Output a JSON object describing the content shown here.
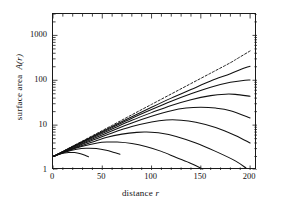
{
  "chart_data": {
    "type": "line",
    "title": "",
    "xlabel": "distance r",
    "ylabel": "surface area A(r)",
    "xlabel_plain": "distance",
    "xlabel_italic": "r",
    "ylabel_plain": "surface area",
    "ylabel_italic": "A(r)",
    "xlim": [
      0,
      207
    ],
    "ylim": [
      1,
      3000
    ],
    "yscale": "log",
    "xscale": "linear",
    "grid": false,
    "legend": false,
    "xticks": [
      0,
      50,
      100,
      150,
      200
    ],
    "xticklabels": [
      "0",
      "50",
      "100",
      "150",
      "200"
    ],
    "xminor_step": 10,
    "yticks": [
      1,
      10,
      100,
      1000
    ],
    "yticklabels": [
      "1",
      "10",
      "100",
      "1000"
    ],
    "frame": "box",
    "tick_direction": "in",
    "series": [
      {
        "name": "asymptote",
        "style": "dashed",
        "color": "#222222",
        "points": [
          [
            0,
            2.0
          ],
          [
            20,
            3.4
          ],
          [
            40,
            5.8
          ],
          [
            60,
            9.9
          ],
          [
            80,
            17.0
          ],
          [
            100,
            29.0
          ],
          [
            120,
            49.5
          ],
          [
            140,
            84.5
          ],
          [
            160,
            144
          ],
          [
            180,
            246
          ],
          [
            185,
            286
          ],
          [
            190,
            333
          ],
          [
            200,
            450
          ]
        ]
      },
      {
        "name": "curve-1",
        "style": "solid",
        "color": "#111111",
        "points": [
          [
            0,
            2.0
          ],
          [
            20,
            3.35
          ],
          [
            40,
            5.6
          ],
          [
            60,
            9.3
          ],
          [
            80,
            15.4
          ],
          [
            100,
            25.0
          ],
          [
            120,
            40.0
          ],
          [
            140,
            62.0
          ],
          [
            160,
            96.0
          ],
          [
            180,
            140
          ],
          [
            195,
            190
          ],
          [
            200,
            205
          ]
        ]
      },
      {
        "name": "curve-2",
        "style": "solid",
        "color": "#111111",
        "points": [
          [
            0,
            2.0
          ],
          [
            20,
            3.3
          ],
          [
            40,
            5.4
          ],
          [
            60,
            8.8
          ],
          [
            80,
            14.2
          ],
          [
            100,
            22.2
          ],
          [
            120,
            34.0
          ],
          [
            140,
            50.0
          ],
          [
            160,
            70.0
          ],
          [
            180,
            90.0
          ],
          [
            195,
            100
          ],
          [
            200,
            101
          ]
        ]
      },
      {
        "name": "curve-3",
        "style": "solid",
        "color": "#111111",
        "points": [
          [
            0,
            2.0
          ],
          [
            20,
            3.25
          ],
          [
            40,
            5.2
          ],
          [
            60,
            8.2
          ],
          [
            80,
            12.8
          ],
          [
            100,
            19.0
          ],
          [
            120,
            27.5
          ],
          [
            140,
            37.0
          ],
          [
            160,
            45.5
          ],
          [
            175,
            49.0
          ],
          [
            185,
            48.5
          ],
          [
            200,
            44.0
          ]
        ]
      },
      {
        "name": "curve-4",
        "style": "solid",
        "color": "#111111",
        "points": [
          [
            0,
            2.0
          ],
          [
            20,
            3.15
          ],
          [
            40,
            4.9
          ],
          [
            60,
            7.5
          ],
          [
            80,
            11.2
          ],
          [
            100,
            15.8
          ],
          [
            120,
            21.0
          ],
          [
            135,
            24.0
          ],
          [
            150,
            25.0
          ],
          [
            165,
            24.0
          ],
          [
            180,
            21.0
          ],
          [
            200,
            14.5
          ]
        ]
      },
      {
        "name": "curve-5",
        "style": "solid",
        "color": "#111111",
        "points": [
          [
            0,
            2.0
          ],
          [
            20,
            3.05
          ],
          [
            40,
            4.6
          ],
          [
            60,
            6.7
          ],
          [
            80,
            9.3
          ],
          [
            100,
            11.8
          ],
          [
            115,
            13.0
          ],
          [
            130,
            12.9
          ],
          [
            145,
            11.6
          ],
          [
            165,
            8.9
          ],
          [
            185,
            5.9
          ],
          [
            200,
            4.0
          ]
        ]
      },
      {
        "name": "curve-6",
        "style": "solid",
        "color": "#111111",
        "points": [
          [
            0,
            2.0
          ],
          [
            20,
            2.95
          ],
          [
            40,
            4.2
          ],
          [
            55,
            5.4
          ],
          [
            70,
            6.3
          ],
          [
            85,
            6.9
          ],
          [
            95,
            7.0
          ],
          [
            110,
            6.6
          ],
          [
            125,
            5.6
          ],
          [
            145,
            4.0
          ],
          [
            165,
            2.6
          ],
          [
            185,
            1.6
          ],
          [
            196,
            1.1
          ]
        ]
      },
      {
        "name": "curve-7",
        "style": "solid",
        "color": "#111111",
        "points": [
          [
            0,
            2.0
          ],
          [
            15,
            2.7
          ],
          [
            30,
            3.4
          ],
          [
            45,
            4.0
          ],
          [
            55,
            4.2
          ],
          [
            65,
            4.2
          ],
          [
            80,
            3.9
          ],
          [
            95,
            3.3
          ],
          [
            110,
            2.6
          ],
          [
            125,
            1.9
          ],
          [
            140,
            1.4
          ],
          [
            152,
            1.05
          ]
        ]
      },
      {
        "name": "curve-8",
        "style": "solid",
        "color": "#111111",
        "points": [
          [
            0,
            2.0
          ],
          [
            12,
            2.5
          ],
          [
            24,
            2.9
          ],
          [
            34,
            3.05
          ],
          [
            44,
            3.0
          ],
          [
            54,
            2.75
          ],
          [
            62,
            2.45
          ],
          [
            68,
            2.25
          ]
        ]
      },
      {
        "name": "curve-9",
        "style": "solid",
        "color": "#111111",
        "points": [
          [
            0,
            2.0
          ],
          [
            8,
            2.3
          ],
          [
            16,
            2.45
          ],
          [
            22,
            2.45
          ],
          [
            28,
            2.3
          ],
          [
            33,
            2.1
          ],
          [
            36,
            1.98
          ]
        ]
      }
    ]
  }
}
